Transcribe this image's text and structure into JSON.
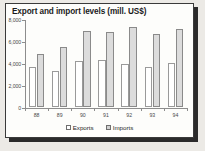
{
  "chart_data": {
    "type": "bar",
    "title": "Export and import levels (mill. US$)",
    "xlabel": "",
    "ylabel": "",
    "categories": [
      "88",
      "89",
      "90",
      "91",
      "92",
      "93",
      "94"
    ],
    "series": [
      {
        "name": "Exports",
        "values": [
          3600,
          3300,
          4200,
          4250,
          3950,
          3600,
          4000
        ],
        "color": "#ffffff"
      },
      {
        "name": "Imports",
        "values": [
          4800,
          5500,
          6900,
          6850,
          7300,
          6650,
          7100
        ],
        "color": "#dcdcdc"
      }
    ],
    "ylim": [
      0,
      8000
    ],
    "yticks": [
      0,
      2000,
      4000,
      6000,
      8000
    ],
    "ytick_labels": [
      "0",
      "2,000",
      "4,000",
      "6,000",
      "8,000"
    ],
    "grid": false,
    "legend_position": "bottom"
  },
  "legend": {
    "exports_label": "Exports",
    "imports_label": "Imports"
  }
}
